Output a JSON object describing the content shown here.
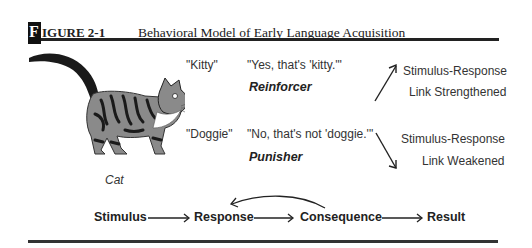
{
  "figure": {
    "initial": "F",
    "label": "IGURE 2-1",
    "title": "Behavioral Model of Early Language Acquisition"
  },
  "image": {
    "subject": "cat-illustration",
    "caption": "Cat"
  },
  "branches": [
    {
      "child_utterance": "\"Kitty\"",
      "adult_reply": "\"Yes, that's 'kitty.'\"",
      "consequence_type": "Reinforcer",
      "outcome_line1": "Stimulus-Response",
      "outcome_line2": "Link Strengthened",
      "arrow_direction": "up"
    },
    {
      "child_utterance": "\"Doggie\"",
      "adult_reply": "\"No, that's not 'doggie.'\"",
      "consequence_type": "Punisher",
      "outcome_line1": "Stimulus-Response",
      "outcome_line2": "Link Weakened",
      "arrow_direction": "down"
    }
  ],
  "flow": {
    "steps": [
      "Stimulus",
      "Response",
      "Consequence",
      "Result"
    ],
    "feedback": "Consequence → Response"
  },
  "colors": {
    "ink": "#222222",
    "cat_fur": "#8a8a8a",
    "cat_stripes": "#1a1a1a"
  }
}
